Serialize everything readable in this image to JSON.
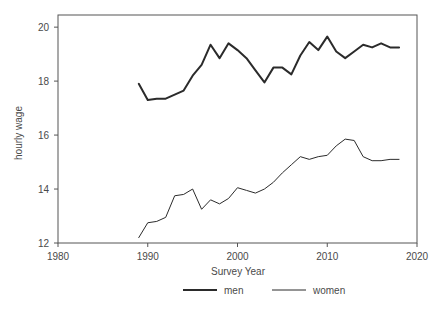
{
  "chart_data": {
    "type": "line",
    "title": "",
    "xlabel": "Survey Year",
    "ylabel": "hourly wage",
    "xlim": [
      1980,
      2020
    ],
    "ylim": [
      12,
      20.45
    ],
    "xticks": [
      1980,
      1990,
      2000,
      2010,
      2020
    ],
    "yticks": [
      12,
      14,
      16,
      18,
      20
    ],
    "grid": false,
    "legend_position": "bottom",
    "x": [
      1989,
      1990,
      1991,
      1992,
      1993,
      1994,
      1995,
      1996,
      1997,
      1998,
      1999,
      2000,
      2001,
      2002,
      2003,
      2004,
      2005,
      2006,
      2007,
      2008,
      2009,
      2010,
      2011,
      2012,
      2013,
      2014,
      2015,
      2016,
      2017,
      2018
    ],
    "series": [
      {
        "name": "men",
        "values": [
          17.9,
          17.3,
          17.35,
          17.35,
          17.5,
          17.65,
          18.2,
          18.6,
          19.35,
          18.85,
          19.4,
          19.15,
          18.85,
          18.4,
          17.95,
          18.5,
          18.5,
          18.25,
          18.95,
          19.45,
          19.15,
          19.65,
          19.1,
          18.85,
          19.1,
          19.35,
          19.25,
          19.4,
          19.25,
          19.25
        ]
      },
      {
        "name": "women",
        "values": [
          12.2,
          12.75,
          12.8,
          12.95,
          13.75,
          13.8,
          14.0,
          13.25,
          13.6,
          13.45,
          13.65,
          14.05,
          13.95,
          13.85,
          14.0,
          14.25,
          14.6,
          14.9,
          15.2,
          15.1,
          15.2,
          15.25,
          15.6,
          15.85,
          15.8,
          15.2,
          15.05,
          15.05,
          15.1,
          15.1
        ]
      }
    ],
    "legend": [
      {
        "label": "men",
        "style": "thick"
      },
      {
        "label": "women",
        "style": "thin"
      }
    ],
    "colors": {
      "series_line": "#2b2b2b",
      "frame": "#555555",
      "text": "#4a4a4a",
      "background": "#ffffff"
    },
    "tick_labels": {
      "x": [
        "1980",
        "1990",
        "2000",
        "2010",
        "2020"
      ],
      "y": [
        "12",
        "14",
        "16",
        "18",
        "20"
      ]
    }
  }
}
